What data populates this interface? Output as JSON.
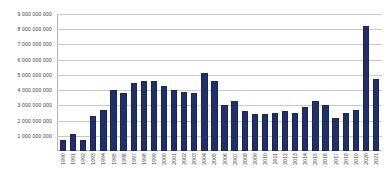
{
  "chart_data": {
    "type": "bar",
    "title": "",
    "subtitle": "",
    "xlabel": "",
    "ylabel": "",
    "ylim": [
      0,
      9000000000
    ],
    "ytick_step": 1000000000,
    "grid": true,
    "legend": "none",
    "bar_color": "#1f3070",
    "gridline_color": "#c9c9c9",
    "ytick_labels": [
      "1 000 000 000",
      "2 000 000 000",
      "3 000 000 000",
      "4 000 000 000",
      "5 000 000 000",
      "6 000 000 000",
      "7 000 000 000",
      "8 000 000 000",
      "9 000 000 000"
    ],
    "ytick_values": [
      1000000000,
      2000000000,
      3000000000,
      4000000000,
      5000000000,
      6000000000,
      7000000000,
      8000000000,
      9000000000
    ],
    "categories": [
      "1990",
      "1991",
      "1992",
      "1993",
      "1994",
      "1995",
      "1996",
      "1997",
      "1998",
      "1999",
      "2000",
      "2001",
      "2002",
      "2003",
      "2004",
      "2005",
      "2006",
      "2007",
      "2008",
      "2009",
      "2010",
      "2011",
      "2012",
      "2013",
      "2014",
      "2015",
      "2016",
      "2017",
      "2018",
      "2019",
      "2020",
      "2021"
    ],
    "values": [
      750000000,
      1100000000,
      700000000,
      2300000000,
      2700000000,
      4000000000,
      3800000000,
      4500000000,
      4600000000,
      4600000000,
      4300000000,
      4000000000,
      3900000000,
      3800000000,
      5100000000,
      4600000000,
      3000000000,
      3300000000,
      2600000000,
      2400000000,
      2400000000,
      2500000000,
      2600000000,
      2500000000,
      2900000000,
      3300000000,
      3000000000,
      2200000000,
      2500000000,
      2700000000,
      8200000000,
      4700000000
    ]
  }
}
